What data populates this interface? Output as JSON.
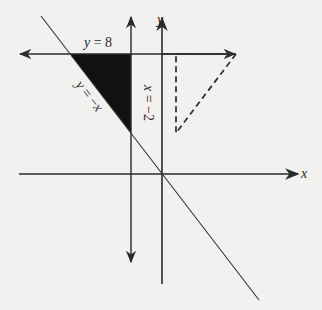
{
  "diagram": {
    "type": "coordinate-plane",
    "axes": {
      "x_label": "x",
      "y_label": "y",
      "origin_px": [
        162,
        174
      ],
      "units_per_px": 0.0667
    },
    "lines": [
      {
        "id": "horizontal",
        "equation": "y = 8",
        "label_var": "y",
        "label_rest": " = 8",
        "style": "solid-arrows"
      },
      {
        "id": "vertical",
        "equation": "x = −2",
        "label_var": "x",
        "label_rest": " = −2",
        "style": "solid-arrows"
      },
      {
        "id": "diagonal",
        "equation": "y = −x",
        "label_var": "y",
        "label_rest": " = −",
        "label_var2": "x",
        "style": "solid"
      }
    ],
    "shaded_region": {
      "description": "triangle bounded by y = 8, x = -2 and y = -x",
      "vertices": [
        [
          -8,
          8
        ],
        [
          -2,
          8
        ],
        [
          -2,
          2
        ]
      ],
      "fill": "#111111"
    },
    "dashed_triangle": {
      "description": "reflection-like dashed triangle in first quadrant",
      "vertices": [
        [
          1,
          8
        ],
        [
          5,
          8
        ],
        [
          1,
          2.7
        ]
      ],
      "stroke": "#333333"
    },
    "colors": {
      "background": "#f1f1ef",
      "ink": "#2a2a2a"
    }
  }
}
